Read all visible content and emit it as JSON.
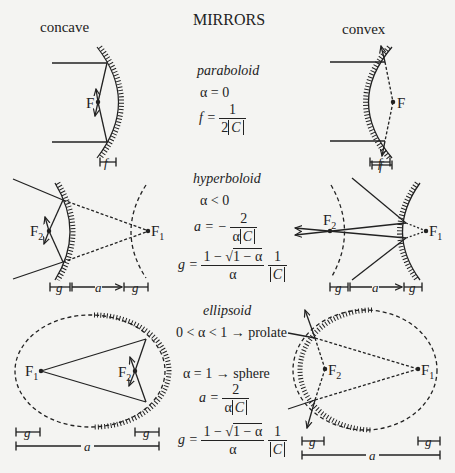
{
  "title": "MIRRORS",
  "columns": {
    "left": "concave",
    "right": "convex"
  },
  "colors": {
    "background": "#f4f4f2",
    "ink": "#222222"
  },
  "sections": {
    "paraboloid": {
      "name": "paraboloid",
      "condition": "α = 0",
      "formula_lhs": "f =",
      "formula_num": "1",
      "formula_den_prefix": "2",
      "formula_den_abs": "C",
      "concave": {
        "focus": "F",
        "dim": "f"
      },
      "convex": {
        "focus": "F",
        "dim": "f"
      }
    },
    "hyperboloid": {
      "name": "hyperboloid",
      "condition": "α < 0",
      "a_lhs": "a = −",
      "a_num": "2",
      "a_den_prefix": "α",
      "a_den_abs": "C",
      "g_lhs": "g =",
      "g_num_prefix": "1 − ",
      "g_num_sqrt": "1 − α",
      "g_den": "α",
      "g2_num": "1",
      "g2_den_abs": "C",
      "concave": {
        "focus1": "F",
        "focus1_sub": "1",
        "focus2": "F",
        "focus2_sub": "2",
        "dims": [
          "g",
          "a",
          "g"
        ]
      },
      "convex": {
        "focus1": "F",
        "focus1_sub": "1",
        "focus2": "F",
        "focus2_sub": "2",
        "dims": [
          "g",
          "a",
          "g"
        ],
        "dim_top": "f"
      }
    },
    "ellipsoid": {
      "name": "ellipsoid",
      "condition1": "0 < α < 1 → prolate",
      "condition2": "α = 1  → sphere",
      "a_lhs": "a =",
      "a_num": "2",
      "a_den_prefix": "α",
      "a_den_abs": "C",
      "g_lhs": "g =",
      "g_num_prefix": "1 − ",
      "g_num_sqrt": "1 − α",
      "g_den": "α",
      "g2_num": "1",
      "g2_den_abs": "C",
      "concave": {
        "focus1": "F",
        "focus1_sub": "1",
        "focus2": "F",
        "focus2_sub": "2",
        "dims": [
          "g",
          "g",
          "a"
        ]
      },
      "convex": {
        "focus1": "F",
        "focus1_sub": "1",
        "focus2": "F",
        "focus2_sub": "2",
        "dims": [
          "g",
          "g",
          "a"
        ]
      }
    }
  }
}
